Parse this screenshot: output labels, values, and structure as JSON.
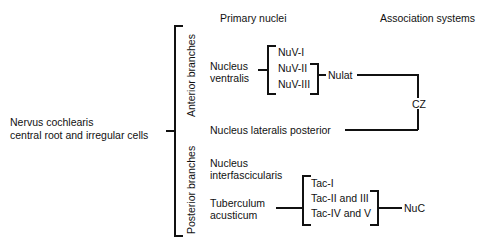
{
  "headers": {
    "primary": "Primary nuclei",
    "association": "Association systems"
  },
  "root": {
    "line1": "Nervus cochlearis",
    "line2": "central root and irregular cells"
  },
  "branches": {
    "anterior": "Anterior branches",
    "posterior": "Posterior branches"
  },
  "nuclei": {
    "ventralis": {
      "line1": "Nucleus",
      "line2": "ventralis"
    },
    "lateralis_posterior": "Nucleus  lateralis  posterior",
    "interfascicularis": {
      "line1": "Nucleus",
      "line2": "interfascicularis"
    },
    "tuberculum": {
      "line1": "Tuberculum",
      "line2": "acusticum"
    }
  },
  "subdivisions": {
    "nuv": [
      "NuV-I",
      "NuV-II",
      "NuV-III"
    ],
    "tac": [
      "Tac-I",
      "Tac-II and III",
      "Tac-IV and V"
    ]
  },
  "association": {
    "nulat": "Nulat",
    "cz": "CZ",
    "nuc": "NuC"
  }
}
